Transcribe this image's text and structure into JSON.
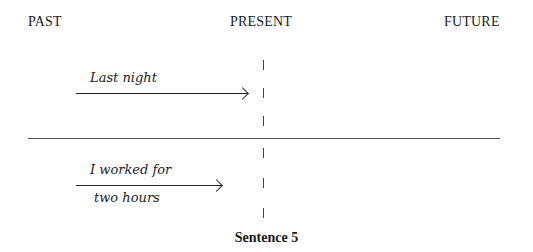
{
  "timeline": {
    "labels": {
      "past": "PAST",
      "present": "PRESENT",
      "future": "FUTURE"
    }
  },
  "upper": {
    "annotation": "Last night"
  },
  "lower": {
    "annotation_line1": "I worked for",
    "annotation_line2": "two hours"
  },
  "caption": "Sentence 5"
}
